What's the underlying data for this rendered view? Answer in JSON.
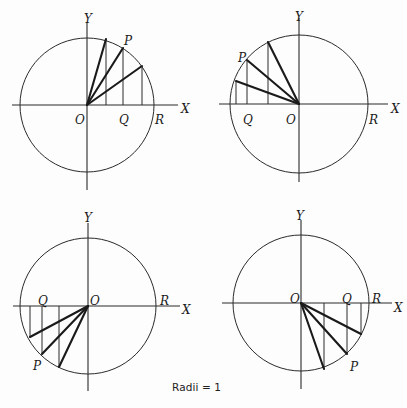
{
  "figure": {
    "caption": "Radii = 1",
    "diagrams": [
      {
        "name": "quadrant-1",
        "center": [
          87,
          105
        ],
        "radius": 67,
        "x_axis": [
          12,
          178
        ],
        "y_axis": [
          22,
          190
        ],
        "radii_endpoints": [
          [
            106,
            39
          ],
          [
            123,
            48
          ],
          [
            142,
            66
          ]
        ],
        "labels": {
          "Y": {
            "text": "Y",
            "x": 84,
            "y": 19
          },
          "X": {
            "text": "X",
            "x": 181,
            "y": 109
          },
          "O": {
            "text": "O",
            "x": 75,
            "y": 120
          },
          "Q": {
            "text": "Q",
            "x": 119,
            "y": 120
          },
          "R": {
            "text": "R",
            "x": 155,
            "y": 120
          },
          "P": {
            "text": "P",
            "x": 124,
            "y": 41
          }
        }
      },
      {
        "name": "quadrant-2",
        "center": [
          299,
          104
        ],
        "radius": 69,
        "x_axis": [
          219,
          388
        ],
        "y_axis": [
          18,
          182
        ],
        "radii_endpoints": [
          [
            268,
            42
          ],
          [
            247,
            60
          ],
          [
            236,
            81
          ]
        ],
        "labels": {
          "Y": {
            "text": "Y",
            "x": 295,
            "y": 17
          },
          "X": {
            "text": "X",
            "x": 391,
            "y": 109
          },
          "O": {
            "text": "O",
            "x": 286,
            "y": 120
          },
          "Q": {
            "text": "Q",
            "x": 243,
            "y": 120
          },
          "R": {
            "text": "R",
            "x": 369,
            "y": 120
          },
          "P": {
            "text": "P",
            "x": 238,
            "y": 58
          }
        }
      },
      {
        "name": "quadrant-3",
        "center": [
          88,
          306
        ],
        "radius": 68,
        "x_axis": [
          13,
          180
        ],
        "y_axis": [
          223,
          391
        ],
        "radii_endpoints": [
          [
            59,
            367
          ],
          [
            42,
            354
          ],
          [
            30,
            337
          ]
        ],
        "labels": {
          "Y": {
            "text": "Y",
            "x": 84,
            "y": 218
          },
          "X": {
            "text": "X",
            "x": 182,
            "y": 310
          },
          "O": {
            "text": "O",
            "x": 90,
            "y": 301
          },
          "Q": {
            "text": "Q",
            "x": 38,
            "y": 301
          },
          "R": {
            "text": "R",
            "x": 160,
            "y": 301
          },
          "P": {
            "text": "P",
            "x": 33,
            "y": 366
          }
        }
      },
      {
        "name": "quadrant-4",
        "center": [
          301,
          303
        ],
        "radius": 68,
        "x_axis": [
          222,
          392
        ],
        "y_axis": [
          220,
          389
        ],
        "radii_endpoints": [
          [
            324,
            369
          ],
          [
            347,
            354
          ],
          [
            361,
            334
          ]
        ],
        "labels": {
          "Y": {
            "text": "Y",
            "x": 296,
            "y": 216
          },
          "X": {
            "text": "X",
            "x": 394,
            "y": 308
          },
          "O": {
            "text": "O",
            "x": 290,
            "y": 299
          },
          "Q": {
            "text": "Q",
            "x": 342,
            "y": 299
          },
          "R": {
            "text": "R",
            "x": 372,
            "y": 299
          },
          "P": {
            "text": "P",
            "x": 350,
            "y": 367
          }
        }
      }
    ]
  }
}
